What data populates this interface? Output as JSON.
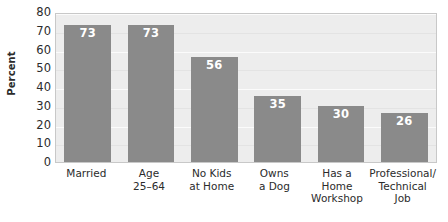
{
  "title": {
    "text": "",
    "cropped": true
  },
  "chart_data": {
    "type": "bar",
    "title": "",
    "xlabel": "",
    "ylabel": "Percent",
    "ylim": [
      0,
      80
    ],
    "ytick_step": 10,
    "yticks": [
      "80",
      "70",
      "60",
      "50",
      "40",
      "30",
      "20",
      "10",
      "0"
    ],
    "grid": true,
    "legend": "none",
    "bar_color": "#8a8a8a",
    "plot_background": "#ededed",
    "value_label_color": "#ffffff",
    "categories": [
      "Married",
      "Age\n25–64",
      "No Kids\nat Home",
      "Owns\na Dog",
      "Has a\nHome\nWorkshop",
      "Professional/\nTechnical\nJob"
    ],
    "values": [
      73,
      73,
      56,
      35,
      30,
      26
    ],
    "bars": [
      {
        "label": "Married",
        "label_lines": [
          "Married"
        ],
        "value": 73,
        "value_text": "73"
      },
      {
        "label": "Age 25–64",
        "label_lines": [
          "Age",
          "25–64"
        ],
        "value": 73,
        "value_text": "73"
      },
      {
        "label": "No Kids at Home",
        "label_lines": [
          "No Kids",
          "at Home"
        ],
        "value": 56,
        "value_text": "56"
      },
      {
        "label": "Owns a Dog",
        "label_lines": [
          "Owns",
          "a Dog"
        ],
        "value": 35,
        "value_text": "35"
      },
      {
        "label": "Has a Home Workshop",
        "label_lines": [
          "Has a",
          "Home",
          "Workshop"
        ],
        "value": 30,
        "value_text": "30"
      },
      {
        "label": "Professional/Technical Job",
        "label_lines": [
          "Professional/",
          "Technical",
          "Job"
        ],
        "value": 26,
        "value_text": "26"
      }
    ]
  }
}
